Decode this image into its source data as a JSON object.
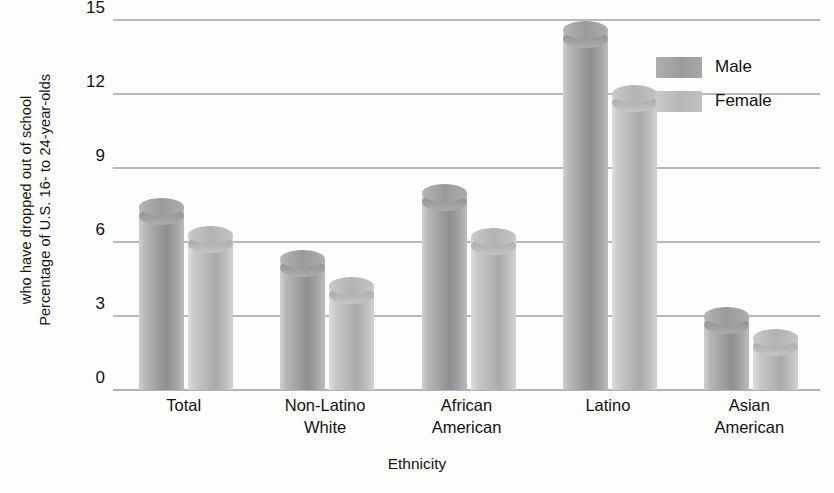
{
  "chart_data": {
    "type": "bar",
    "title": "",
    "subtitle": "",
    "xlabel": "Ethnicity",
    "ylabel": "Percentage of U.S. 16- to 24-year-olds who have dropped out of school",
    "ylabel_line1": "Percentage of U.S. 16- to 24-year-olds",
    "ylabel_line2": "who have dropped out of school",
    "categories": [
      "Total",
      "Non-Latino White",
      "African American",
      "Latino",
      "Asian American"
    ],
    "category_lines": [
      [
        "Total"
      ],
      [
        "Non-Latino",
        "White"
      ],
      [
        "African",
        "American"
      ],
      [
        "Latino"
      ],
      [
        "Asian",
        "American"
      ]
    ],
    "series": [
      {
        "name": "Male",
        "values": [
          7.4,
          5.3,
          8.0,
          14.6,
          3.0
        ],
        "color": "#9c9c9c"
      },
      {
        "name": "Female",
        "values": [
          6.3,
          4.2,
          6.2,
          12.0,
          2.1
        ],
        "color": "#bcbcbc"
      }
    ],
    "ylim": [
      0,
      15
    ],
    "yticks": [
      0,
      3,
      6,
      9,
      12,
      15
    ],
    "ytick_labels": [
      "0",
      "3",
      "6",
      "9",
      "12",
      "15"
    ],
    "grid": true,
    "grid_axis": "y",
    "legend_position": "top-right",
    "bar_style": "3d-cylinder",
    "background_color": "#fdfdfc",
    "grid_color": "#b9b9b9"
  },
  "legend": {
    "items": [
      {
        "label": "Male"
      },
      {
        "label": "Female"
      }
    ]
  }
}
